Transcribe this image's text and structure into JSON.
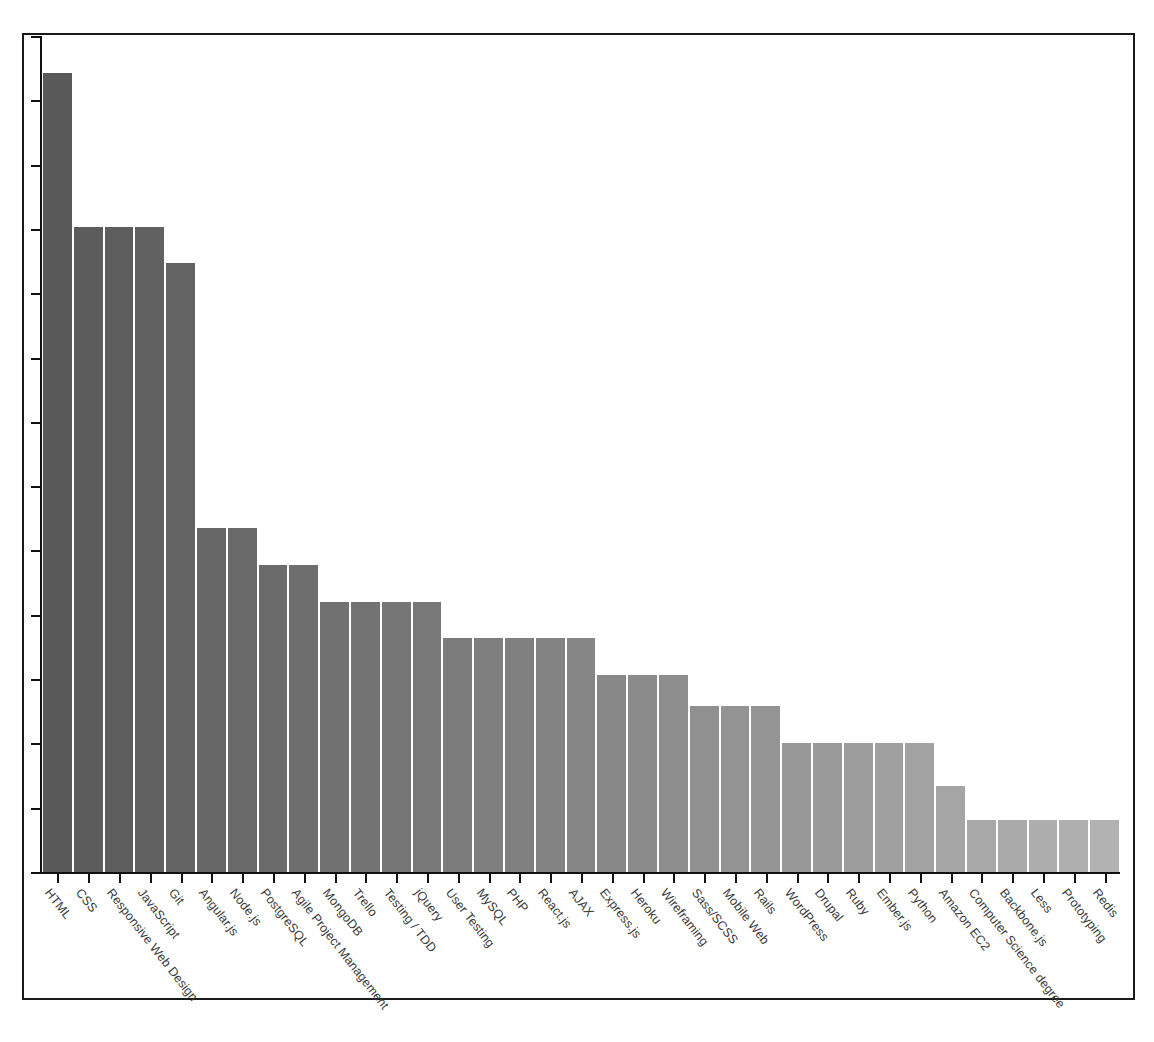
{
  "chart_data": {
    "type": "bar",
    "title": "",
    "subtitle": "",
    "xlabel": "",
    "ylabel": "",
    "legend": [],
    "grid": false,
    "axis_tick_labels_visible": false,
    "y_tick_count": 13,
    "ylim": [
      0,
      13.6
    ],
    "orientation": "vertical",
    "sorted": "descending",
    "bar_color_gradient": [
      "#595959",
      "#b0b0b0"
    ],
    "categories": [
      "HTML",
      "CSS",
      "Responsive Web Design",
      "JavaScript",
      "Git",
      "Angular.js",
      "Node.js",
      "PostgreSQL",
      "Agile Project Management",
      "MongoDB",
      "Trello",
      "Testing / TDD",
      "jQuery",
      "User Testing",
      "MySQL",
      "PHP",
      "React.js",
      "AJAX",
      "Express.js",
      "Heroku",
      "Wireframing",
      "Sass/SCSS",
      "Mobile Web",
      "Rails",
      "WordPress",
      "Drupal",
      "Ruby",
      "Ember.js",
      "Python",
      "Amazon EC2",
      "Computer Science degree",
      "Backbone.js",
      "Less",
      "Prototyping",
      "Redis"
    ],
    "values": [
      13.0,
      10.5,
      10.5,
      10.5,
      9.9,
      5.6,
      5.6,
      5.0,
      5.0,
      4.4,
      4.4,
      4.4,
      4.4,
      3.8,
      3.8,
      3.8,
      3.8,
      3.8,
      3.2,
      3.2,
      3.2,
      2.7,
      2.7,
      2.7,
      2.1,
      2.1,
      2.1,
      2.1,
      2.1,
      1.4,
      0.85,
      0.85,
      0.85,
      0.85,
      0.85
    ]
  },
  "figure": {
    "background_color": "#ffffff",
    "border_color": "#1a1a1a",
    "axis_color": "#111111"
  }
}
